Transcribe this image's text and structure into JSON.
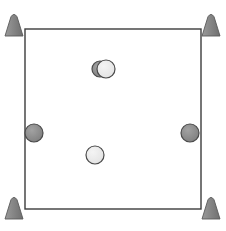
{
  "scene": {
    "title": "arena-overhead-view",
    "width": 226,
    "height": 231,
    "background_color": "#ffffff"
  },
  "arena": {
    "name": "square-boundary",
    "x": 25,
    "y": 29,
    "width": 176,
    "height": 180,
    "stroke_color": "#3c3c3c",
    "stroke_width": 1.4,
    "fill_color": "#ffffff"
  },
  "corner_markers": {
    "label": "cone-marker",
    "fill_color": "#848484",
    "stroke_color": "#5a5a5a",
    "count": 4,
    "items": [
      {
        "name": "cone-marker-top-left",
        "cx": 14,
        "cy": 24,
        "w": 18,
        "h": 24
      },
      {
        "name": "cone-marker-top-right",
        "cx": 211,
        "cy": 24,
        "w": 18,
        "h": 24
      },
      {
        "name": "cone-marker-bottom-left",
        "cx": 14,
        "cy": 207,
        "w": 18,
        "h": 24
      },
      {
        "name": "cone-marker-bottom-right",
        "cx": 211,
        "cy": 207,
        "w": 18,
        "h": 24
      }
    ]
  },
  "pucks": {
    "dark_fill_color": "#8c8c8c",
    "light_fill_color": "#e8e8e8",
    "stroke_color": "#4a4a4a",
    "items": [
      {
        "name": "puck-dark-upper-center",
        "type": "dark",
        "cx": 100,
        "cy": 69,
        "r": 8
      },
      {
        "name": "puck-light-upper-center",
        "type": "light",
        "cx": 106,
        "cy": 69,
        "r": 9
      },
      {
        "name": "puck-dark-left-edge",
        "type": "dark",
        "cx": 34,
        "cy": 133,
        "r": 9
      },
      {
        "name": "puck-dark-right-edge",
        "type": "dark",
        "cx": 190,
        "cy": 133,
        "r": 9
      },
      {
        "name": "puck-light-lower-center",
        "type": "light",
        "cx": 95,
        "cy": 155,
        "r": 9
      }
    ]
  }
}
